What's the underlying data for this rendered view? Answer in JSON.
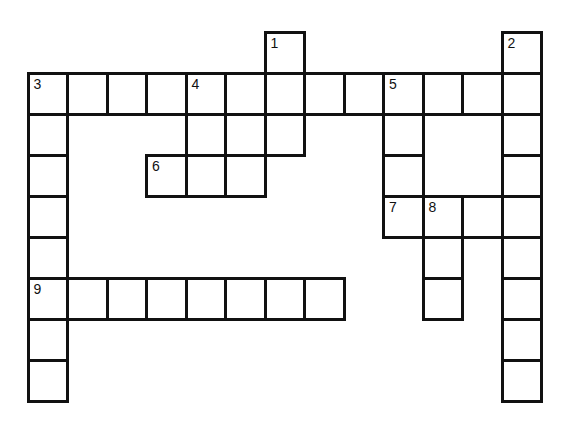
{
  "puzzle": {
    "type": "crossword",
    "rows": 9,
    "cols": 13,
    "origin": {
      "x": 28,
      "y": 32
    },
    "cell_w": 39.5,
    "cell_h": 41,
    "colors": {
      "line": "#111111",
      "background": "#ffffff"
    },
    "cells": [
      [
        0,
        6
      ],
      [
        0,
        12
      ],
      [
        1,
        0
      ],
      [
        1,
        1
      ],
      [
        1,
        2
      ],
      [
        1,
        3
      ],
      [
        1,
        4
      ],
      [
        1,
        5
      ],
      [
        1,
        6
      ],
      [
        1,
        7
      ],
      [
        1,
        8
      ],
      [
        1,
        9
      ],
      [
        1,
        10
      ],
      [
        1,
        11
      ],
      [
        1,
        12
      ],
      [
        2,
        0
      ],
      [
        2,
        4
      ],
      [
        2,
        5
      ],
      [
        2,
        6
      ],
      [
        2,
        9
      ],
      [
        2,
        12
      ],
      [
        3,
        0
      ],
      [
        3,
        3
      ],
      [
        3,
        4
      ],
      [
        3,
        5
      ],
      [
        3,
        9
      ],
      [
        3,
        12
      ],
      [
        4,
        0
      ],
      [
        4,
        9
      ],
      [
        4,
        10
      ],
      [
        4,
        11
      ],
      [
        4,
        12
      ],
      [
        5,
        0
      ],
      [
        5,
        10
      ],
      [
        5,
        12
      ],
      [
        6,
        0
      ],
      [
        6,
        1
      ],
      [
        6,
        2
      ],
      [
        6,
        3
      ],
      [
        6,
        4
      ],
      [
        6,
        5
      ],
      [
        6,
        6
      ],
      [
        6,
        7
      ],
      [
        6,
        10
      ],
      [
        6,
        12
      ],
      [
        7,
        0
      ],
      [
        7,
        12
      ],
      [
        8,
        0
      ],
      [
        8,
        12
      ]
    ],
    "numbers": [
      {
        "label": "1",
        "row": 0,
        "col": 6
      },
      {
        "label": "2",
        "row": 0,
        "col": 12
      },
      {
        "label": "3",
        "row": 1,
        "col": 0
      },
      {
        "label": "4",
        "row": 1,
        "col": 4
      },
      {
        "label": "5",
        "row": 1,
        "col": 9
      },
      {
        "label": "6",
        "row": 3,
        "col": 3
      },
      {
        "label": "7",
        "row": 4,
        "col": 9
      },
      {
        "label": "8",
        "row": 4,
        "col": 10
      },
      {
        "label": "9",
        "row": 6,
        "col": 0
      }
    ]
  }
}
